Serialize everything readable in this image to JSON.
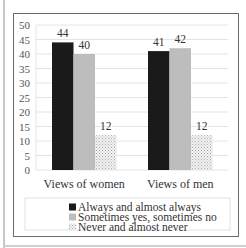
{
  "chart_data": {
    "type": "bar",
    "title": "",
    "xlabel": "",
    "ylabel": "",
    "categories": [
      "Views of women",
      "Views of men"
    ],
    "series": [
      {
        "name": "Always and almost always",
        "values": [
          44,
          41
        ],
        "color": "#1a1a1a",
        "pattern": "solid"
      },
      {
        "name": "Sometimes yes, sometimes no",
        "values": [
          40,
          42
        ],
        "color": "#bdbdbd",
        "pattern": "solid"
      },
      {
        "name": "Never and almost never",
        "values": [
          12,
          12
        ],
        "color": "#e6e6e6",
        "pattern": "dotted"
      }
    ],
    "ylim": [
      0,
      50
    ],
    "yticks": [
      0,
      5,
      10,
      15,
      20,
      25,
      30,
      35,
      40,
      45,
      50
    ],
    "grid": true,
    "legend_position": "bottom"
  }
}
